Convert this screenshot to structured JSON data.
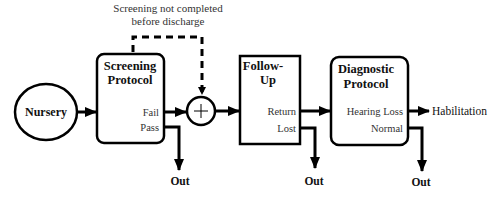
{
  "diagram": {
    "annotation": {
      "line1": "Screening not completed",
      "line2": "before discharge"
    },
    "nodes": {
      "nursery": {
        "label": "Nursery"
      },
      "screening": {
        "title1": "Screening",
        "title2": "Protocol",
        "out_fail": "Fail",
        "out_pass": "Pass"
      },
      "junction": {
        "symbol": "+"
      },
      "followup": {
        "title1": "Follow-",
        "title2": "Up",
        "out_return": "Return",
        "out_lost": "Lost"
      },
      "diagnostic": {
        "title1": "Diagnostic",
        "title2": "Protocol",
        "out_hearing_loss": "Hearing Loss",
        "out_normal": "Normal"
      },
      "habilitation": {
        "label": "Habilitation"
      }
    },
    "exits": {
      "pass_out": "Out",
      "lost_out": "Out",
      "normal_out": "Out"
    },
    "colors": {
      "stroke": "#000000",
      "background": "#ffffff"
    }
  }
}
